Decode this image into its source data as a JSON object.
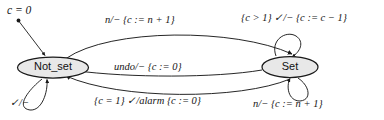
{
  "diagram": {
    "type": "state-machine",
    "title_annotation": "c = 0",
    "states": [
      {
        "id": "not_set",
        "label": "Not_set"
      },
      {
        "id": "set",
        "label": "Set"
      }
    ],
    "transitions": {
      "top_arc": "n/− {c := n + 1}",
      "middle_arc": "undo/− {c := 0}",
      "bottom_arc": "{c = 1} ✓/alarm {c := 0}",
      "not_set_self_loop": "✓/−",
      "set_self_loop_top": "{c > 1} ✓/− {c := c − 1}",
      "set_self_loop_bottom": "n/− {c := n + 1}"
    },
    "colors": {
      "stroke": "#1a1a1a",
      "state_fill": "#e8e8e8",
      "background": "#ffffff",
      "text": "#151515"
    }
  }
}
